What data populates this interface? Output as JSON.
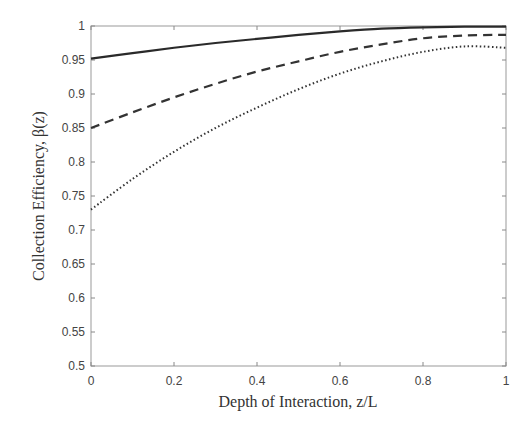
{
  "chart_data": {
    "type": "line",
    "title": "",
    "xlabel": "Depth of Interaction, z/L",
    "ylabel": "Collection Efficiency, β(z)",
    "xlim": [
      0,
      1
    ],
    "ylim": [
      0.5,
      1
    ],
    "grid": false,
    "legend": null,
    "x_ticks": [
      "0",
      "0.2",
      "0.4",
      "0.6",
      "0.8",
      "1"
    ],
    "y_ticks": [
      "0.5",
      "0.55",
      "0.6",
      "0.65",
      "0.7",
      "0.75",
      "0.8",
      "0.85",
      "0.9",
      "0.95",
      "1"
    ],
    "x": [
      0,
      0.1,
      0.2,
      0.3,
      0.4,
      0.5,
      0.6,
      0.7,
      0.8,
      0.9,
      1.0
    ],
    "series": [
      {
        "name": "solid",
        "style": "solid",
        "values": [
          0.952,
          0.96,
          0.968,
          0.975,
          0.981,
          0.987,
          0.992,
          0.996,
          0.998,
          0.999,
          0.999
        ]
      },
      {
        "name": "dashed",
        "style": "dashed",
        "values": [
          0.85,
          0.873,
          0.895,
          0.915,
          0.933,
          0.948,
          0.962,
          0.973,
          0.982,
          0.986,
          0.987
        ]
      },
      {
        "name": "dotted",
        "style": "dotted",
        "values": [
          0.73,
          0.775,
          0.815,
          0.85,
          0.88,
          0.907,
          0.93,
          0.948,
          0.962,
          0.97,
          0.968
        ]
      }
    ]
  }
}
